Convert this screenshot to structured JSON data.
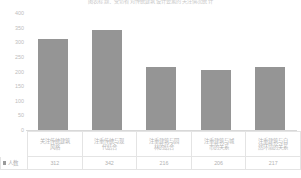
{
  "chart_data": {
    "type": "bar",
    "title": "图表标题：受访者对传统建筑设计要素的关注情况统计",
    "xlabel": "",
    "ylabel": "",
    "ylim": [
      0,
      400
    ],
    "ytick_labels": [
      "400",
      "350",
      "300",
      "250",
      "200",
      "150",
      "100",
      "50",
      "0"
    ],
    "ytick_values": [
      400,
      350,
      300,
      250,
      200,
      150,
      100,
      50,
      0
    ],
    "grid": false,
    "legend": [
      "人数"
    ],
    "legend_position": "bottom-left",
    "categories": [
      "关注传统建筑风格",
      "注重传统与现代结合",
      "注重建筑与园林的结合",
      "注重建筑与城市的关系",
      "注重建筑与自然环境的关系"
    ],
    "category_lines": [
      [
        "关注传统建筑",
        "风格"
      ],
      [
        "注重传统与现",
        "代结合"
      ],
      [
        "注重建筑与园",
        "林的结合"
      ],
      [
        "注重建筑与城",
        "市的关系"
      ],
      [
        "注重建筑与自",
        "然环境的关系"
      ]
    ],
    "series": [
      {
        "name": "人数",
        "values": [
          312,
          342,
          216,
          206,
          217
        ],
        "color": "#959595"
      }
    ],
    "value_labels": [
      "312",
      "342",
      "216",
      "206",
      "217"
    ]
  },
  "colors": {
    "bar": "#959595",
    "axis": "#d8d8d8",
    "table_border": "#e4e4e4",
    "text": "#b2b2b2",
    "title_text": "#c9c9c9"
  }
}
